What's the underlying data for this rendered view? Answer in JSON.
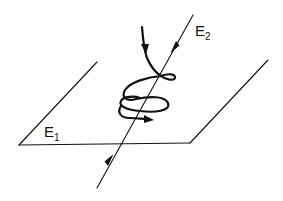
{
  "diagram": {
    "type": "physics-illustration",
    "plane": {
      "label_main": "E",
      "label_sub": "1"
    },
    "field_line": {
      "label_main": "E",
      "label_sub": "2"
    },
    "colors": {
      "ink": "#111111",
      "background": "#ffffff"
    }
  }
}
